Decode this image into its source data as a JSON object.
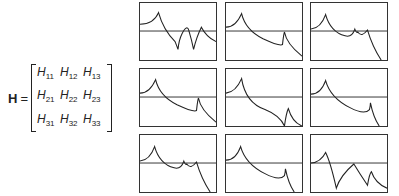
{
  "equation": {
    "lhs": "H",
    "equals": "=",
    "matrix": [
      [
        {
          "base": "H",
          "sub": "11"
        },
        {
          "base": "H",
          "sub": "12"
        },
        {
          "base": "H",
          "sub": "13"
        }
      ],
      [
        {
          "base": "H",
          "sub": "21"
        },
        {
          "base": "H",
          "sub": "22"
        },
        {
          "base": "H",
          "sub": "23"
        }
      ],
      [
        {
          "base": "H",
          "sub": "31"
        },
        {
          "base": "H",
          "sub": "32"
        },
        {
          "base": "H",
          "sub": "33"
        }
      ]
    ]
  },
  "plots": [
    {
      "id": "H11",
      "path": "M0,22 Q14,22 19,10 Q24,28 36,40 Q38,45 39,48 Q40,38 43,32 Q48,22 50,28 Q53,38 55,48 Q58,35 63,25 Q68,35 78,40"
    },
    {
      "id": "H12",
      "path": "M0,25 Q10,25 16,11 Q20,28 38,37 Q55,45 58,43 Q59,33 60,30 Q62,42 78,55"
    },
    {
      "id": "H13",
      "path": "M0,27 Q10,26 15,12 Q20,30 35,34 Q42,36 45,27 Q47,32 48,30 Q52,36 58,28 Q63,45 72,59"
    },
    {
      "id": "H21",
      "path": "M0,25 Q10,25 16,11 Q20,28 38,37 Q55,45 58,43 Q59,33 60,30 Q62,42 78,55"
    },
    {
      "id": "H22",
      "path": "M0,25 Q10,24 16,10 Q20,35 40,42 Q55,48 60,59 Q62,45 64,41 Q68,55 78,59"
    },
    {
      "id": "H23",
      "path": "M0,26 Q10,26 15,12 Q20,30 40,40 Q55,48 60,42 Q61,38 61,35 Q64,50 70,59"
    },
    {
      "id": "H31",
      "path": "M0,27 Q10,26 15,12 Q20,30 35,34 Q42,36 45,27 Q47,32 48,30 Q52,36 58,28 Q63,45 72,59"
    },
    {
      "id": "H32",
      "path": "M0,26 Q10,26 15,12 Q20,30 40,40 Q55,48 60,42 Q61,38 61,35 Q64,50 70,59"
    },
    {
      "id": "H33",
      "path": "M0,29 Q10,28 15,18 Q20,28 26,55 Q30,42 44,30 Q50,40 58,52 Q60,40 62,38 Q66,50 78,55"
    }
  ]
}
